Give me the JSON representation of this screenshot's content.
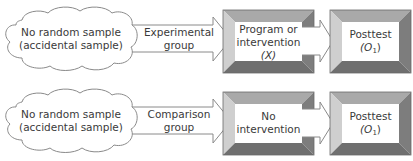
{
  "diagram": {
    "type": "nonequivalent-groups-posttest-only-design",
    "colors": {
      "outline": "#8a8a8a",
      "bevel_top": "#a9a9a9",
      "bevel_left": "#cfcfcf",
      "bevel_right": "#7d7d7d",
      "bevel_bottom": "#6f6f6f",
      "fill": "#ffffff",
      "text": "#3a3a3a"
    },
    "rows": [
      {
        "sample": {
          "line1": "No random sample",
          "line2": "(accidental sample)"
        },
        "group": {
          "line1": "Experimental",
          "line2": "group"
        },
        "treatment": {
          "line1": "Program or",
          "line2": "intervention",
          "line3": "(X)"
        },
        "outcome": {
          "line1": "Posttest",
          "line2_pre": "(O",
          "line2_sub": "1",
          "line2_post": ")"
        }
      },
      {
        "sample": {
          "line1": "No random sample",
          "line2": "(accidental sample)"
        },
        "group": {
          "line1": "Comparison",
          "line2": "group"
        },
        "treatment": {
          "line1": "No",
          "line2": "intervention"
        },
        "outcome": {
          "line1": "Posttest",
          "line2_pre": "(O",
          "line2_sub": "1",
          "line2_post": ")"
        }
      }
    ]
  }
}
